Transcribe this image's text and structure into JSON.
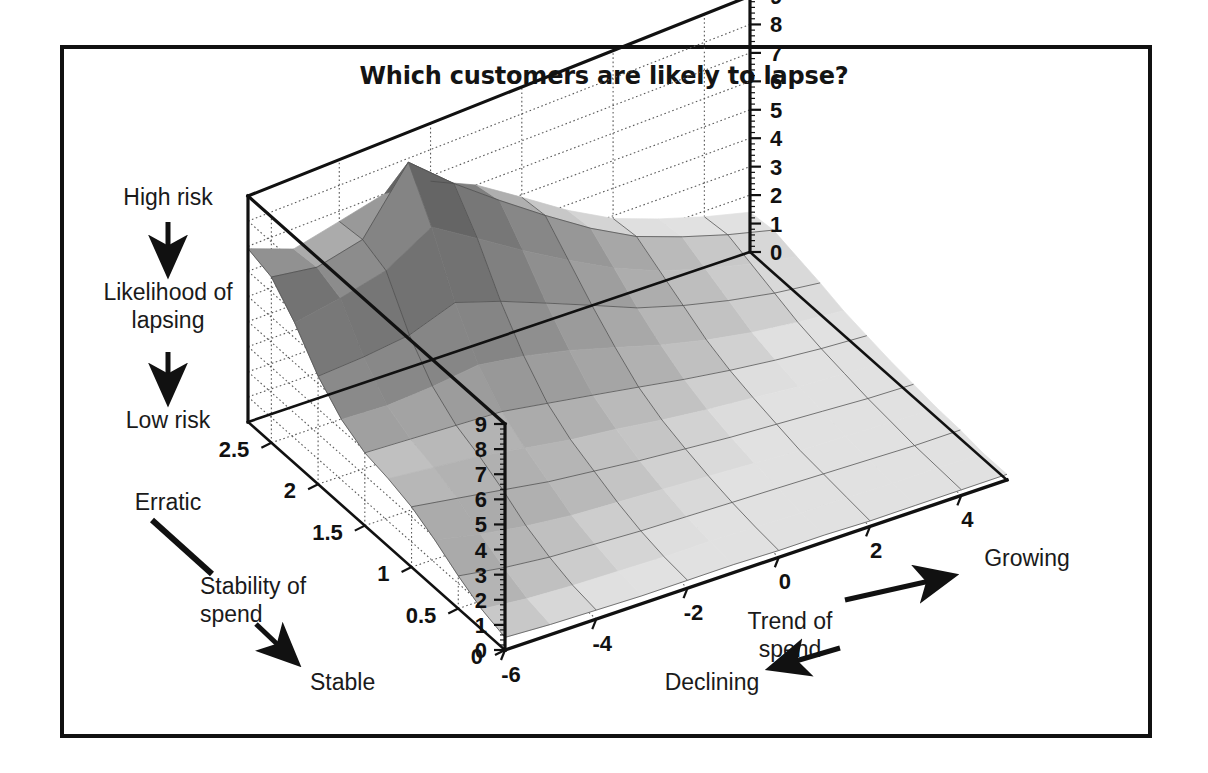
{
  "figure": {
    "title": "Which customers are likely to lapse?",
    "frame_color": "#111111",
    "background": "#ffffff"
  },
  "annotations": {
    "z_high": "High risk",
    "z_low": "Low risk",
    "z_name_line1": "Likelihood of",
    "z_name_line2": "lapsing",
    "y_high": "Erratic",
    "y_low": "Stable",
    "y_name_line1": "Stability of",
    "y_name_line2": "spend",
    "x_low": "Declining",
    "x_high": "Growing",
    "x_name_line1": "Trend of",
    "x_name_line2": "spend"
  },
  "chart_data": {
    "type": "surface",
    "title": "Which customers are likely to lapse?",
    "xlabel": "Trend of spend",
    "ylabel": "Stability of spend",
    "zlabel": "Likelihood of lapsing",
    "xlim": [
      -6,
      5
    ],
    "ylim": [
      0,
      2.75
    ],
    "zlim": [
      0,
      9
    ],
    "x_ticks": [
      -6,
      -4,
      -2,
      0,
      2,
      4
    ],
    "y_ticks": [
      0,
      0.5,
      1,
      1.5,
      2,
      2.5
    ],
    "z_ticks": [
      0,
      1,
      2,
      3,
      4,
      5,
      6,
      7,
      8,
      9
    ],
    "z_ticks_left": [
      9,
      8,
      7,
      6,
      5,
      4,
      3,
      2,
      1,
      0
    ],
    "z_ticks_right": [
      9,
      8,
      7,
      6,
      5,
      4,
      3,
      2,
      1,
      0
    ],
    "grid": true,
    "legend": false,
    "x": [
      -6,
      -5,
      -4,
      -3,
      -2,
      -1,
      0,
      1,
      2,
      3,
      4,
      5
    ],
    "y": [
      0,
      0.25,
      0.5,
      0.75,
      1,
      1.25,
      1.5,
      1.75,
      2,
      2.25,
      2.5,
      2.75
    ],
    "surface_color": "#9a9a9a",
    "mesh_color": "#4d4d4d",
    "z": [
      [
        0.5,
        0.4,
        0.35,
        0.3,
        0.3,
        0.3,
        0.25,
        0.25,
        0.2,
        0.2,
        0.2,
        0.2
      ],
      [
        0.8,
        0.6,
        0.5,
        0.45,
        0.4,
        0.4,
        0.35,
        0.3,
        0.3,
        0.25,
        0.25,
        0.2
      ],
      [
        1.3,
        1.0,
        0.8,
        0.7,
        0.6,
        0.55,
        0.5,
        0.45,
        0.4,
        0.35,
        0.3,
        0.3
      ],
      [
        1.9,
        1.5,
        1.2,
        1.0,
        0.9,
        0.8,
        0.7,
        0.6,
        0.5,
        0.45,
        0.4,
        0.35
      ],
      [
        2.4,
        2.1,
        1.8,
        1.5,
        1.3,
        1.1,
        0.95,
        0.8,
        0.7,
        0.6,
        0.5,
        0.45
      ],
      [
        2.7,
        2.5,
        2.3,
        2.0,
        1.7,
        1.5,
        1.25,
        1.05,
        0.9,
        0.75,
        0.65,
        0.55
      ],
      [
        2.9,
        2.8,
        2.7,
        2.6,
        2.3,
        2.0,
        1.7,
        1.4,
        1.15,
        0.95,
        0.8,
        0.7
      ],
      [
        3.4,
        3.3,
        3.4,
        3.6,
        3.3,
        2.9,
        2.4,
        1.9,
        1.5,
        1.2,
        1.0,
        0.85
      ],
      [
        4.3,
        4.4,
        4.6,
        5.2,
        4.6,
        3.9,
        3.2,
        2.5,
        2.0,
        1.6,
        1.3,
        1.1
      ],
      [
        5.6,
        5.9,
        6.3,
        7.3,
        6.2,
        5.1,
        4.1,
        3.2,
        2.5,
        2.0,
        1.6,
        1.3
      ],
      [
        6.6,
        6.3,
        6.7,
        9.0,
        7.5,
        6.2,
        5.0,
        3.9,
        3.0,
        2.4,
        1.9,
        1.5
      ],
      [
        6.9,
        6.2,
        6.6,
        7.0,
        6.8,
        6.0,
        4.9,
        3.8,
        2.9,
        2.3,
        1.8,
        1.4
      ]
    ]
  },
  "projection": {
    "origin_front": [
      505,
      650
    ],
    "corner_left": [
      248,
      422
    ],
    "corner_right": [
      1007,
      480
    ],
    "corner_back": [
      668,
      207
    ],
    "top_left": [
      248,
      196
    ],
    "top_right": [
      1007,
      224
    ],
    "top_back": [
      668,
      155
    ],
    "z_height_left": 226,
    "z_height_right": 256,
    "z_height_back": 242
  }
}
